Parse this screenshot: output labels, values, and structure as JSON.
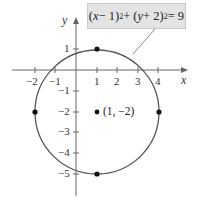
{
  "equation": {
    "text": "(x − 1)² + (y + 2)² = 9",
    "parts": [
      "(",
      "x",
      " − 1)",
      "2",
      " + (",
      "y",
      " + 2)",
      "2",
      " = 9"
    ]
  },
  "axes": {
    "x_label": "x",
    "y_label": "y",
    "x_ticks": [
      {
        "value": -2,
        "label": "−2"
      },
      {
        "value": -1,
        "label": "−1"
      },
      {
        "value": 1,
        "label": "1"
      },
      {
        "value": 2,
        "label": "2"
      },
      {
        "value": 3,
        "label": "3"
      },
      {
        "value": 4,
        "label": "4"
      }
    ],
    "y_ticks": [
      {
        "value": 1,
        "label": "1"
      },
      {
        "value": -1,
        "label": "−1"
      },
      {
        "value": -2,
        "label": "−2"
      },
      {
        "value": -3,
        "label": "−3"
      },
      {
        "value": -4,
        "label": "−4"
      },
      {
        "value": -5,
        "label": "−5"
      }
    ]
  },
  "circle": {
    "center": [
      1,
      -2
    ],
    "radius": 3
  },
  "points": [
    {
      "x": 1,
      "y": 1
    },
    {
      "x": -2,
      "y": -2
    },
    {
      "x": 4,
      "y": -2
    },
    {
      "x": 1,
      "y": -5
    },
    {
      "x": 1,
      "y": -2,
      "label": "(1, −2)"
    }
  ],
  "colors": {
    "stroke": "#555555",
    "box": "#e4e4e4",
    "point": "#111111"
  }
}
